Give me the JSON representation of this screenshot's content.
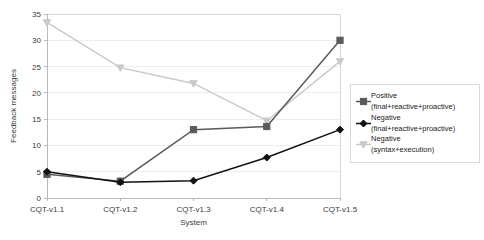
{
  "chart_data": {
    "type": "line",
    "title": "",
    "xlabel": "System",
    "ylabel": "Feedback messages",
    "categories": [
      "CQT-v1.1",
      "CQT-v1.2",
      "CQT-v1.3",
      "CQT-v1.4",
      "CQT-v1.5"
    ],
    "ylim": [
      0,
      35
    ],
    "yticks": [
      0,
      5,
      10,
      15,
      20,
      25,
      30,
      35
    ],
    "grid": true,
    "legend_position": "right",
    "series": [
      {
        "name": "Positive (final+reactive+proactive)",
        "name_line1": "Positive",
        "name_line2": "(final+reactive+proactive)",
        "color": "#5a5a5a",
        "marker": "square",
        "values": [
          4.5,
          3.2,
          13.0,
          13.6,
          30.0
        ]
      },
      {
        "name": "Negative (final+reactive+proactive)",
        "name_line1": "Negative",
        "name_line2": "(final+reactive+proactive)",
        "color": "#111111",
        "marker": "diamond",
        "values": [
          5.0,
          3.0,
          3.3,
          7.7,
          13.0
        ]
      },
      {
        "name": "Negative (syntax+execution)",
        "name_line1": "Negative",
        "name_line2": "(syntax+execution)",
        "color": "#c9c9c9",
        "marker": "triangle-down",
        "values": [
          33.4,
          24.8,
          21.8,
          14.7,
          26.0
        ]
      }
    ]
  },
  "axis": {
    "ylabel": "Feedback messages",
    "xlabel": "System",
    "yticks": [
      "0",
      "5",
      "10",
      "15",
      "20",
      "25",
      "30",
      "35"
    ],
    "xticks": [
      "CQT-v1.1",
      "CQT-v1.2",
      "CQT-v1.3",
      "CQT-v1.4",
      "CQT-v1.5"
    ]
  },
  "legend": {
    "entries": [
      {
        "line1": "Positive",
        "line2": "(final+reactive+proactive)"
      },
      {
        "line1": "Negative",
        "line2": "(final+reactive+proactive)"
      },
      {
        "line1": "Negative",
        "line2": "(syntax+execution)"
      }
    ]
  }
}
